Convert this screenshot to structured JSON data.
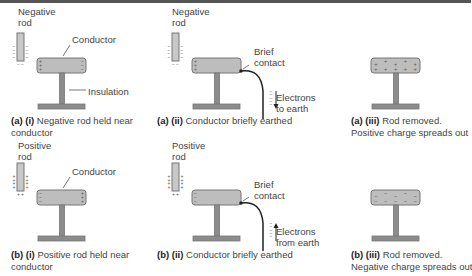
{
  "colors": {
    "conductor_fill": "#bdbdbd",
    "stand_fill": "#8c8c8c",
    "outline": "#777777",
    "text": "#444444"
  },
  "panels": {
    "a1": {
      "rod_label_line1": "Negative",
      "rod_label_line2": "rod",
      "conductor_label": "Conductor",
      "insulation_label": "Insulation",
      "caption_tag": "(a) (i)",
      "caption_line1": " Negative rod held near",
      "caption_line2": "conductor"
    },
    "a2": {
      "rod_label_line1": "Negative",
      "rod_label_line2": "rod",
      "contact_label_line1": "Brief",
      "contact_label_line2": "contact",
      "electrons_label_line1": "Electrons",
      "electrons_label_line2": "to earth",
      "caption_tag": "(a) (ii)",
      "caption_line1": " Conductor briefly earthed"
    },
    "a3": {
      "caption_tag": "(a) (iii)",
      "caption_line1": " Rod removed.",
      "caption_line2": "Positive charge spreads out"
    },
    "b1": {
      "rod_label_line1": "Positive",
      "rod_label_line2": "rod",
      "conductor_label": "Conductor",
      "caption_tag": "(b) (i)",
      "caption_line1": " Positive rod held near",
      "caption_line2": "conductor"
    },
    "b2": {
      "rod_label_line1": "Positive",
      "rod_label_line2": "rod",
      "contact_label_line1": "Brief",
      "contact_label_line2": "contact",
      "electrons_label_line1": "Electrons",
      "electrons_label_line2": "from earth",
      "caption_tag": "(b) (ii)",
      "caption_line1": " Conductor briefly earthed"
    },
    "b3": {
      "caption_tag": "(b) (iii)",
      "caption_line1": " Rod removed.",
      "caption_line2": "Negative charge spreads out"
    }
  },
  "symbols": {
    "plus": "+",
    "minus": "−"
  }
}
